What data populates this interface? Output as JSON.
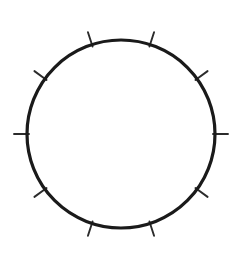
{
  "figure": {
    "name": "circle-with-radial-ticks",
    "canvas": {
      "width": 243,
      "height": 254,
      "background_color": "#ffffff"
    },
    "circle": {
      "center_x": 121,
      "center_y": 134,
      "radius": 94,
      "stroke_color": "#1a1a1a",
      "stroke_width": 3.2,
      "fill": "none"
    },
    "ticks": {
      "count": 10,
      "angle_step_degrees": 36,
      "start_angle_degrees": 18,
      "inner_offset": -2,
      "length": 15,
      "stroke_color": "#2b2b2b",
      "stroke_width": 1.9,
      "angles_degrees": [
        18,
        54,
        90,
        126,
        162,
        198,
        234,
        270,
        306,
        342
      ]
    }
  }
}
